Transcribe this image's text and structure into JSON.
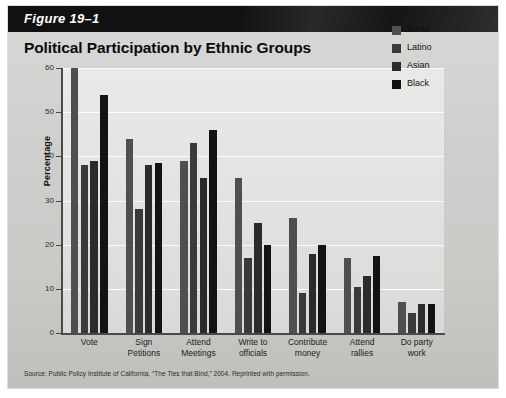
{
  "figure": {
    "number_label": "Figure 19–1",
    "title": "Political Participation by Ethnic Groups",
    "source_note": "Source: Public Policy Institute of California, “The Ties that Bind,” 2004. Reprinted with permission."
  },
  "chart_data": {
    "type": "bar",
    "title": "Political Participation by Ethnic Groups",
    "xlabel": "",
    "ylabel": "Percentage",
    "ylim": [
      0,
      60
    ],
    "yticks": [
      "0",
      "10",
      "20",
      "30",
      "40",
      "50",
      "60"
    ],
    "ytick_values": [
      0,
      10,
      20,
      30,
      40,
      50,
      60
    ],
    "grid": true,
    "legend_position": "top-right",
    "categories": [
      "Vote",
      "Sign Petitions",
      "Attend Meetings",
      "Write to officials",
      "Contribute money",
      "Attend rallies",
      "Do party work"
    ],
    "category_lines": [
      [
        "Vote"
      ],
      [
        "Sign",
        "Petitions"
      ],
      [
        "Attend",
        "Meetings"
      ],
      [
        "Write to",
        "officials"
      ],
      [
        "Contribute",
        "money"
      ],
      [
        "Attend",
        "rallies"
      ],
      [
        "Do party",
        "work"
      ]
    ],
    "series": [
      {
        "name": "White",
        "color": "#4f4f4d",
        "values": [
          60,
          44,
          39,
          35,
          26,
          17,
          7
        ]
      },
      {
        "name": "Latino",
        "color": "#3a3a38",
        "values": [
          38,
          28,
          43,
          17,
          9,
          10.5,
          4.5
        ]
      },
      {
        "name": "Asian",
        "color": "#2b2b29",
        "values": [
          39,
          38,
          35,
          25,
          18,
          13,
          6.5
        ]
      },
      {
        "name": "Black",
        "color": "#131313",
        "values": [
          54,
          38.5,
          46,
          20,
          20,
          17.5,
          6.5
        ]
      }
    ]
  },
  "legend": {
    "items": [
      {
        "label": "White",
        "color": "#4f4f4d"
      },
      {
        "label": "Latino",
        "color": "#3a3a38"
      },
      {
        "label": "Asian",
        "color": "#2b2b29"
      },
      {
        "label": "Black",
        "color": "#131313"
      }
    ]
  },
  "colors": {
    "banner": "#111111",
    "card_background": "#cfcfcd",
    "plot_background": "#e4e4e2",
    "axis": "#4a4a48",
    "gridline": "#ffffff"
  }
}
